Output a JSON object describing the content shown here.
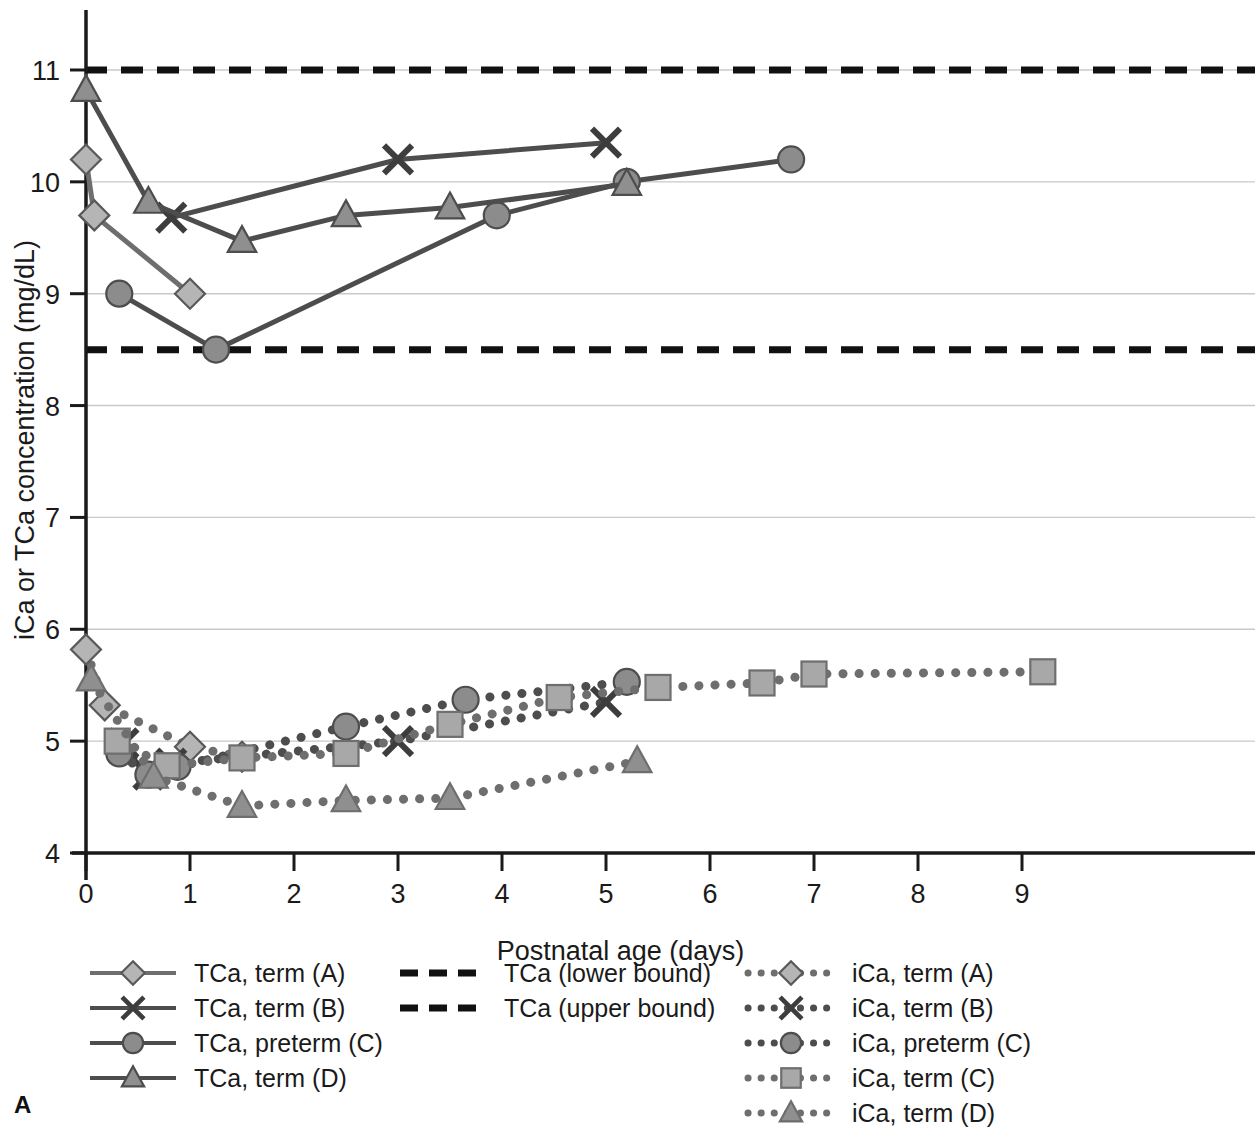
{
  "panel": {
    "label": "A"
  },
  "chart_data": {
    "type": "line",
    "title": "",
    "xlabel": "Postnatal age (days)",
    "ylabel": "iCa or TCa concentration (mg/dL)",
    "xlim": [
      0,
      9.6
    ],
    "ylim": [
      4,
      11.35
    ],
    "xticks": [
      0,
      1,
      2,
      3,
      4,
      5,
      6,
      7,
      8,
      9
    ],
    "xtick_labels": [
      "0",
      "1",
      "2",
      "3",
      "4",
      "5",
      "6",
      "7",
      "8",
      "9"
    ],
    "yticks": [
      4,
      5,
      6,
      7,
      8,
      9,
      10,
      11
    ],
    "ytick_labels": [
      "4",
      "5",
      "6",
      "7",
      "8",
      "9",
      "10",
      "11"
    ],
    "grid": "horizontal",
    "legend_position": "below",
    "series": [
      {
        "name": "TCa, term (A)",
        "marker": "diamond",
        "line_style": "solid",
        "line_color": "#6e6e6e",
        "marker_fill": "#b5b5b5",
        "marker_stroke": "#595959",
        "x": [
          0,
          0.08,
          1
        ],
        "y": [
          10.2,
          9.7,
          9.0
        ]
      },
      {
        "name": "TCa, term (B)",
        "marker": "cross",
        "line_style": "solid",
        "line_color": "#4d4d4d",
        "marker_fill": "#3d3d3d",
        "marker_stroke": "#3d3d3d",
        "x": [
          0.82,
          3.0,
          5.0
        ],
        "y": [
          9.68,
          10.2,
          10.35
        ]
      },
      {
        "name": "TCa, preterm (C)",
        "marker": "circle",
        "line_style": "solid",
        "line_color": "#4d4d4d",
        "marker_fill": "#8c8c8c",
        "marker_stroke": "#4d4d4d",
        "x": [
          0.32,
          1.25,
          3.95,
          5.2,
          6.78
        ],
        "y": [
          9.0,
          8.5,
          9.7,
          10.0,
          10.2
        ]
      },
      {
        "name": "TCa, term (D)",
        "marker": "triangle",
        "line_style": "solid",
        "line_color": "#4d4d4d",
        "marker_fill": "#8f8f8f",
        "marker_stroke": "#4d4d4d",
        "x": [
          0.0,
          0.6,
          1.5,
          2.5,
          3.5,
          5.2
        ],
        "y": [
          10.82,
          9.82,
          9.47,
          9.7,
          9.77,
          9.98
        ]
      },
      {
        "name": "iCa, term (A)",
        "marker": "diamond",
        "line_style": "dotted",
        "line_color": "#6e6e6e",
        "marker_fill": "#b5b5b5",
        "marker_stroke": "#595959",
        "x": [
          0.0,
          0.18,
          1.0,
          1.5
        ],
        "y": [
          5.82,
          5.32,
          4.95,
          4.86
        ]
      },
      {
        "name": "iCa, term (B)",
        "marker": "cross",
        "line_style": "dotted",
        "line_color": "#4d4d4d",
        "marker_fill": "#3d3d3d",
        "marker_stroke": "#3d3d3d",
        "x": [
          0.36,
          0.6,
          0.82,
          3.0,
          5.0
        ],
        "y": [
          4.98,
          4.7,
          4.8,
          5.0,
          5.35
        ]
      },
      {
        "name": "iCa, preterm (C)",
        "marker": "circle",
        "line_style": "dotted",
        "line_color": "#4d4d4d",
        "marker_fill": "#8c8c8c",
        "marker_stroke": "#4d4d4d",
        "x": [
          0.32,
          0.6,
          0.88,
          2.5,
          3.65,
          5.2
        ],
        "y": [
          4.89,
          4.7,
          4.77,
          5.13,
          5.37,
          5.53
        ]
      },
      {
        "name": "iCa, term (C)",
        "marker": "square",
        "line_style": "dotted",
        "line_color": "#6e6e6e",
        "marker_fill": "#a8a8a8",
        "marker_stroke": "#6e6e6e",
        "x": [
          0.3,
          0.78,
          1.5,
          2.5,
          3.5,
          4.55,
          5.5,
          6.5,
          7.0,
          9.2
        ],
        "y": [
          5.0,
          4.78,
          4.85,
          4.89,
          5.15,
          5.39,
          5.48,
          5.52,
          5.6,
          5.62
        ]
      },
      {
        "name": "iCa, term (D)",
        "marker": "triangle",
        "line_style": "dotted",
        "line_color": "#6e6e6e",
        "marker_fill": "#8f8f8f",
        "marker_stroke": "#6e6e6e",
        "x": [
          0.05,
          0.65,
          1.5,
          2.5,
          3.5,
          5.3
        ],
        "y": [
          5.55,
          4.68,
          4.42,
          4.47,
          4.49,
          4.82
        ]
      }
    ],
    "reference_lines": [
      {
        "name": "TCa (lower bound)",
        "value": 8.5,
        "style": "dashed",
        "color": "#111111"
      },
      {
        "name": "TCa (upper bound)",
        "value": 11.0,
        "style": "dashed",
        "color": "#111111"
      }
    ]
  },
  "legend": {
    "columns": [
      {
        "entries": [
          {
            "label": "TCa, term (A)",
            "series": 0
          },
          {
            "label": "TCa, term (B)",
            "series": 1
          },
          {
            "label": "TCa, preterm (C)",
            "series": 2
          },
          {
            "label": "TCa, term (D)",
            "series": 3
          }
        ]
      },
      {
        "entries": [
          {
            "label": "TCa (lower bound)",
            "ref": 0
          },
          {
            "label": "TCa (upper bound)",
            "ref": 1
          }
        ]
      },
      {
        "entries": [
          {
            "label": "iCa, term (A)",
            "series": 4
          },
          {
            "label": "iCa, term (B)",
            "series": 5
          },
          {
            "label": "iCa, preterm (C)",
            "series": 6
          },
          {
            "label": "iCa, term (C)",
            "series": 7
          },
          {
            "label": "iCa, term (D)",
            "series": 8
          }
        ]
      }
    ]
  }
}
